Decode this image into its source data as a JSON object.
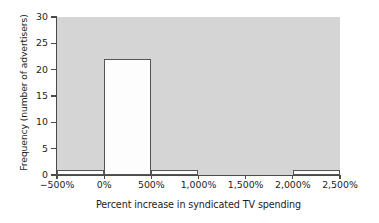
{
  "chart_data": {
    "type": "bar",
    "title": "",
    "subtitle": "",
    "xlabel": "Percent increase in syndicated TV spending",
    "ylabel": "Frequency (number of advertisers)",
    "xlim": [
      -500,
      2500
    ],
    "ylim": [
      0,
      30
    ],
    "grid": false,
    "legend": "none",
    "bin_width": 500,
    "x_tick_labels": [
      "−500%",
      "0%",
      "500%",
      "1,000%",
      "1,500%",
      "2,000%",
      "2,500%"
    ],
    "x_tick_values": [
      -500,
      0,
      500,
      1000,
      1500,
      2000,
      2500
    ],
    "y_tick_labels": [
      "0",
      "5",
      "10",
      "15",
      "20",
      "25",
      "30"
    ],
    "y_tick_values": [
      0,
      5,
      10,
      15,
      20,
      25,
      30
    ],
    "categories": [
      "−500% to 0%",
      "0% to 500%",
      "500% to 1,000%",
      "1,000% to 1,500%",
      "1,500% to 2,000%",
      "2,000% to 2,500%"
    ],
    "bin_edges": [
      -500,
      0,
      500,
      1000,
      1500,
      2000,
      2500
    ],
    "values": [
      1,
      22,
      1,
      0,
      0,
      1
    ],
    "bars": [
      {
        "name": "bin-neg500-0",
        "x0": -500,
        "x1": 0,
        "value": 1
      },
      {
        "name": "bin-0-500",
        "x0": 0,
        "x1": 500,
        "value": 22
      },
      {
        "name": "bin-500-1000",
        "x0": 500,
        "x1": 1000,
        "value": 1
      },
      {
        "name": "bin-1000-1500",
        "x0": 1000,
        "x1": 1500,
        "value": 0
      },
      {
        "name": "bin-1500-2000",
        "x0": 1500,
        "x1": 2000,
        "value": 0
      },
      {
        "name": "bin-2000-2500",
        "x0": 2000,
        "x1": 2500,
        "value": 1
      }
    ],
    "colors": {
      "plot_background": "#d5d5d5",
      "bar_fill": "#fdfdfd",
      "bar_edge": "#555555",
      "axis": "#4a4a4a",
      "text": "#1c1c1c",
      "figure_background": "#ffffff"
    }
  }
}
